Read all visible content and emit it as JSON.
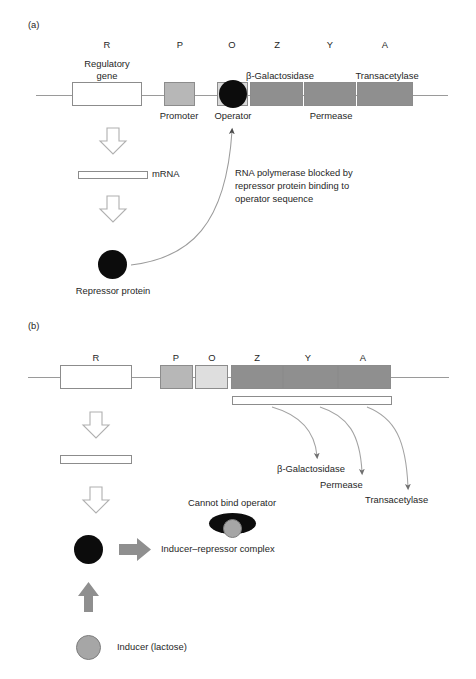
{
  "figure": {
    "panels": [
      {
        "tag": "(a)",
        "state": "repressed",
        "gene_letters": [
          "R",
          "P",
          "O",
          "Z",
          "Y",
          "A"
        ],
        "region_labels": {
          "regulatory_gene": "Regulatory\ngene",
          "regulatory_gene_line1": "Regulatory",
          "regulatory_gene_line2": "gene",
          "promoter": "Promoter",
          "operator": "Operator",
          "beta_galactosidase": "β-Galactosidase",
          "permease": "Permease",
          "transacetylase": "Transacetylase"
        },
        "mrna_label": "mRNA",
        "repressor_label": "Repressor protein",
        "annotation": "RNA polymerase blocked by\nrepressor protein binding to\noperator sequence",
        "annotation_lines": [
          "RNA polymerase blocked by",
          "repressor protein binding to",
          "operator sequence"
        ]
      },
      {
        "tag": "(b)",
        "state": "induced",
        "gene_letters": [
          "R",
          "P",
          "O",
          "Z",
          "Y",
          "A"
        ],
        "product_labels": [
          "β-Galactosidase",
          "Permease",
          "Transacetylase"
        ],
        "cannot_bind_label": "Cannot bind operator",
        "complex_label": "Inducer–repressor complex",
        "inducer_label": "Inducer (lactose)"
      }
    ],
    "colors": {
      "promoter_fill": "#b7b7b7",
      "operator_fill_a": "#d9d9d9",
      "operator_fill_b": "#dedede",
      "structural_gene_fill": "#8f8f8f",
      "regulatory_gene_fill": "#ffffff",
      "protein_black": "#0c0c0c",
      "inducer_gray": "#a6a6a6",
      "arrow_gray": "#8f8f8f",
      "outline": "#8c8c8c",
      "text": "#262626",
      "background": "#ffffff"
    }
  }
}
